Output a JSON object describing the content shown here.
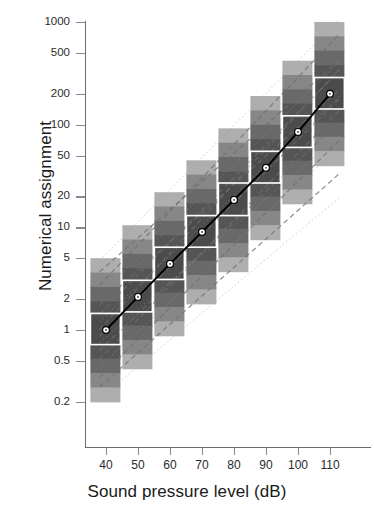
{
  "chart_data": {
    "type": "line",
    "title": "",
    "xlabel": "Sound pressure level (dB)",
    "ylabel": "Numerical assignment",
    "x": [
      40,
      50,
      60,
      70,
      80,
      90,
      100,
      110
    ],
    "xticks": [
      40,
      50,
      60,
      70,
      80,
      90,
      100,
      110
    ],
    "xticklabels": [
      "40",
      "50",
      "60",
      "70",
      "80",
      "90",
      "100",
      "110"
    ],
    "xlim": [
      33,
      118
    ],
    "yticks": [
      1000,
      500,
      200,
      100,
      50,
      20,
      10,
      5,
      2,
      1,
      0.5,
      0.2
    ],
    "yticklabels": [
      "1000",
      "500",
      "200",
      "100",
      "50",
      "20",
      "10",
      "5",
      "2",
      "1",
      "0.5",
      "0.2"
    ],
    "ylim": [
      0.12,
      1400
    ],
    "yscale": "log",
    "grid": false,
    "legend": false,
    "series": [
      {
        "name": "Median numerical assignment",
        "marker": "open-circle",
        "line": "solid",
        "values": [
          1.0,
          2.1,
          4.4,
          9.0,
          18.5,
          38.0,
          85.0,
          200.0
        ]
      }
    ],
    "density_bands": {
      "description": "Grayscale density strips (stacked deciles) of individual magnitude estimates at each sound pressure level",
      "band_count": 10,
      "box_description": "White-outlined interquartile box centred on the median of each column",
      "columns": [
        {
          "x": 40,
          "median": 1.0,
          "box_low": 0.72,
          "box_high": 1.45,
          "low": 0.2,
          "high": 5.0
        },
        {
          "x": 50,
          "median": 2.1,
          "box_low": 1.5,
          "box_high": 3.05,
          "low": 0.42,
          "high": 10.5
        },
        {
          "x": 60,
          "median": 4.4,
          "box_low": 3.1,
          "box_high": 6.4,
          "low": 0.88,
          "high": 22.0
        },
        {
          "x": 70,
          "median": 9.0,
          "box_low": 6.4,
          "box_high": 13.0,
          "low": 1.8,
          "high": 45.0
        },
        {
          "x": 80,
          "median": 18.5,
          "box_low": 13.0,
          "box_high": 27.0,
          "low": 3.7,
          "high": 92.0
        },
        {
          "x": 90,
          "median": 38.0,
          "box_low": 27.0,
          "box_high": 55.0,
          "low": 7.6,
          "high": 190.0
        },
        {
          "x": 100,
          "median": 85.0,
          "box_low": 60.0,
          "box_high": 122.0,
          "low": 17.0,
          "high": 420.0
        },
        {
          "x": 110,
          "median": 200.0,
          "box_low": 142.0,
          "box_high": 288.0,
          "low": 40.0,
          "high": 1000.0
        }
      ]
    },
    "individual_lines": {
      "description": "Faint dashed and dotted straight lines: individual listeners' fitted power functions",
      "style": "dashed/dotted gray",
      "count": 16
    },
    "colors": {
      "axis": "#6b6b6b",
      "text": "#1a1a1a",
      "median_line": "#000000",
      "box_outline": "#ffffff",
      "band_dark": "#4a4a4a",
      "band_light": "#e2e2e2"
    }
  },
  "axes": {
    "y_title": "Numerical assignment",
    "x_title": "Sound pressure level (dB)"
  }
}
